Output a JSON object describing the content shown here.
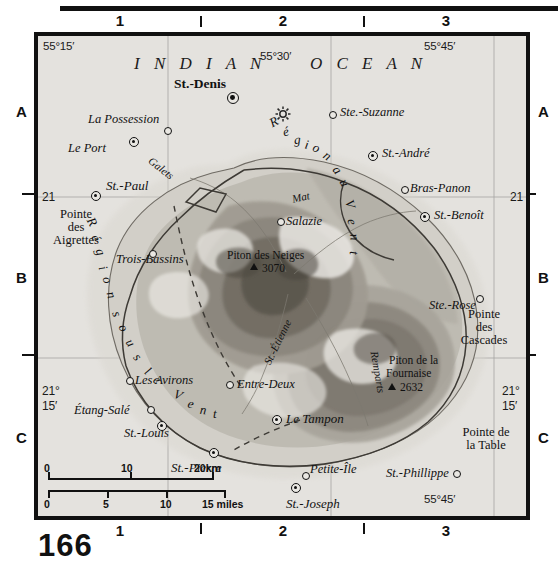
{
  "page": {
    "number": "166"
  },
  "graticule": {
    "top_columns": [
      "1",
      "2",
      "3"
    ],
    "side_rows": [
      "A",
      "B",
      "C"
    ],
    "bottom_columns": [
      "1",
      "2",
      "3"
    ],
    "longitudes": [
      "55°15′",
      "55°30′",
      "55°45′"
    ],
    "lon_bottom_right": "55°45′",
    "lat_left_upper": "21",
    "lat_right_upper": "21",
    "lat_left_lower_deg": "21°",
    "lat_left_lower_min": "15′",
    "lat_right_lower_deg": "21°",
    "lat_right_lower_min": "15′"
  },
  "map": {
    "ocean_label_1": "I N D I A N",
    "ocean_label_2": "O C E A N",
    "regions": [
      {
        "name": "Région au Vent",
        "letters": [
          "R",
          "é",
          "g",
          "i",
          "o",
          "n",
          "a",
          "u",
          "V",
          "e",
          "n",
          "t"
        ]
      },
      {
        "name": "Région sous le Vent",
        "letters": [
          "R",
          "é",
          "g",
          "i",
          "o",
          "n",
          "s",
          "o",
          "u",
          "s",
          "l",
          "e",
          "V",
          "e",
          "n",
          "t"
        ]
      }
    ],
    "capital": {
      "label": "St.-Denis",
      "symbol": "capital-dot"
    },
    "towns": [
      {
        "label": "La Possession",
        "symbol": "small-circle"
      },
      {
        "label": "Le Port",
        "symbol": "double-circle"
      },
      {
        "label": "St.-Paul",
        "symbol": "double-circle"
      },
      {
        "label": "Trois-Bassins",
        "symbol": "small-circle"
      },
      {
        "label": "Ste.-Suzanne",
        "symbol": "small-circle"
      },
      {
        "label": "St.-André",
        "symbol": "double-circle"
      },
      {
        "label": "Bras-Panon",
        "symbol": "small-circle"
      },
      {
        "label": "St.-Benoît",
        "symbol": "double-circle"
      },
      {
        "label": "Salazie",
        "symbol": "small-circle"
      },
      {
        "label": "Ste.-Rose",
        "symbol": "small-circle"
      },
      {
        "label": "Les Avirons",
        "symbol": "small-circle"
      },
      {
        "label": "Entre-Deux",
        "symbol": "small-circle"
      },
      {
        "label": "Étang-Salé",
        "symbol": "small-circle"
      },
      {
        "label": "St.-Louis",
        "symbol": "double-circle"
      },
      {
        "label": "Le Tampon",
        "symbol": "double-circle"
      },
      {
        "label": "St.-Pierre",
        "symbol": "double-circle"
      },
      {
        "label": "Petite-Île",
        "symbol": "small-circle"
      },
      {
        "label": "St.-Joseph",
        "symbol": "double-circle"
      },
      {
        "label": "St.-Phillippe",
        "symbol": "small-circle"
      }
    ],
    "peaks": [
      {
        "name": "Piton des Neiges",
        "elevation": "3070"
      },
      {
        "name": "Piton de la Fournaise",
        "elevation": "2632"
      }
    ],
    "capes": [
      {
        "line1": "Pointe",
        "line2": "des",
        "line3": "Aigrettes"
      },
      {
        "line1": "Pointe",
        "line2": "des",
        "line3": "Cascades"
      },
      {
        "line1": "Pointe de",
        "line2": "la Table",
        "line3": ""
      }
    ],
    "rivers": [
      "Galets",
      "Mat",
      "St.-Étienne",
      "Remparts"
    ]
  },
  "scale": {
    "km_ticks": [
      "0",
      "10",
      "20km"
    ],
    "mile_ticks": [
      "0",
      "5",
      "10",
      "15 miles"
    ]
  },
  "colors": {
    "frame": "#111111",
    "sea": "#e4e2de",
    "land_low": "#cfccc5",
    "land_mid": "#b3afa6",
    "land_high": "#8f8a80",
    "land_peak": "#6d675e",
    "graticule": "#9a9a9a"
  }
}
